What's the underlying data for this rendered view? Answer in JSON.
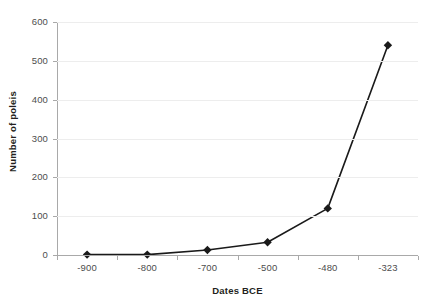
{
  "chart_data": {
    "type": "line",
    "title": "",
    "xlabel": "Dates BCE",
    "ylabel": "Number of poleis",
    "categories": [
      "-900",
      "-800",
      "-700",
      "-500",
      "-480",
      "-323"
    ],
    "values": [
      1,
      1,
      13,
      33,
      120,
      540
    ],
    "series": [
      {
        "name": "Number of poleis",
        "values": [
          1,
          1,
          13,
          33,
          120,
          540
        ]
      }
    ],
    "ylim": [
      0,
      600
    ],
    "ytick_labels": [
      "600",
      "500",
      "400",
      "300",
      "200",
      "100",
      "0"
    ],
    "ytick_values": [
      600,
      500,
      400,
      300,
      200,
      100,
      0
    ],
    "grid": true,
    "legend": false,
    "marker": "diamond",
    "line_color": "#1a1a1a",
    "marker_color": "#1a1a1a",
    "gridline_color": "#ededed",
    "axis_color": "#a9a9a9",
    "background_color": "#ffffff"
  },
  "axes": {
    "y_title": "Number of poleis",
    "x_title": "Dates BCE"
  }
}
